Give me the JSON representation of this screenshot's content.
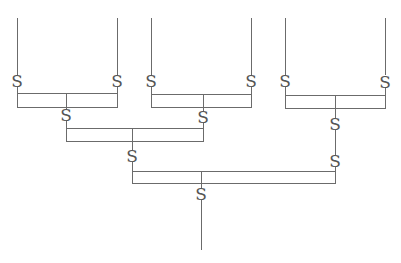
{
  "diagram": {
    "type": "hierarchical bracket / tree of S-hook connectors",
    "symbol": "S",
    "colors": {
      "line": "#6b6b6b",
      "symbol": "#555555",
      "background": "#ffffff"
    },
    "leaves": [
      {
        "id": "L1",
        "x": 17
      },
      {
        "id": "L2",
        "x": 117
      },
      {
        "id": "L3",
        "x": 151
      },
      {
        "id": "L4",
        "x": 251
      },
      {
        "id": "L5",
        "x": 285
      },
      {
        "id": "L6",
        "x": 385
      }
    ],
    "levels": [
      {
        "name": "level-1",
        "groups": [
          {
            "left": 17,
            "right": 117,
            "stem": 66
          },
          {
            "left": 151,
            "right": 251,
            "stem": 203
          },
          {
            "left": 285,
            "right": 385,
            "stem": 335
          }
        ]
      },
      {
        "name": "level-2",
        "groups": [
          {
            "left": 66,
            "right": 203,
            "stem": 132
          }
        ]
      },
      {
        "name": "level-3",
        "groups": [
          {
            "left": 132,
            "right": 335,
            "stem": 201
          }
        ]
      }
    ],
    "symbols": [
      {
        "label": "S",
        "x": 17,
        "y": 81
      },
      {
        "label": "S",
        "x": 117,
        "y": 81
      },
      {
        "label": "S",
        "x": 151,
        "y": 81
      },
      {
        "label": "S",
        "x": 251,
        "y": 81
      },
      {
        "label": "S",
        "x": 285,
        "y": 81
      },
      {
        "label": "S",
        "x": 385,
        "y": 81
      },
      {
        "label": "S",
        "x": 66,
        "y": 115
      },
      {
        "label": "S",
        "x": 203,
        "y": 117
      },
      {
        "label": "S",
        "x": 335,
        "y": 124
      },
      {
        "label": "S",
        "x": 132,
        "y": 156
      },
      {
        "label": "S",
        "x": 335,
        "y": 161
      },
      {
        "label": "S",
        "x": 201,
        "y": 194
      }
    ]
  }
}
